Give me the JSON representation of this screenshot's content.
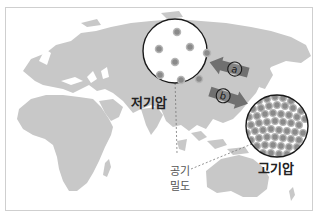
{
  "figure": {
    "low_pressure": {
      "label": "저기압",
      "particle_count": 8
    },
    "high_pressure": {
      "label": "고기압",
      "particle_count": 70
    },
    "arrow_a": {
      "label": "a",
      "direction": "toward-low-from-east"
    },
    "arrow_b": {
      "label": "b",
      "direction": "toward-high"
    },
    "density_label": "공기\n밀도",
    "colors": {
      "land": "#c8c8c8",
      "ocean": "#ffffff",
      "circle_border": "#1a1a1a",
      "particle": "#8a8a8a",
      "arrow": "#707070",
      "frame_border": "#cfcfcf"
    }
  }
}
